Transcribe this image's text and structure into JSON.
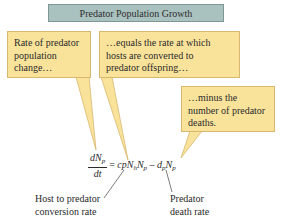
{
  "title": "Predator Population Growth",
  "callouts": [
    {
      "id": "rate-change",
      "lines": [
        "Rate of predator",
        "population",
        "change…"
      ]
    },
    {
      "id": "conversion",
      "lines": [
        "…equals the rate at which",
        "hosts are converted to",
        "predator offspring…"
      ]
    },
    {
      "id": "deaths",
      "lines": [
        "…minus the",
        "number of predator",
        "deaths."
      ]
    }
  ],
  "equation": {
    "numerator": "dN",
    "numerator_sub": "p",
    "denominator": "dt",
    "equals": "=",
    "term1_coef": "cpN",
    "term1_sub1": "h",
    "term1_N": "N",
    "term1_sub2": "p",
    "minus": "–",
    "term2_d": "d",
    "term2_sub1": "p",
    "term2_N": "N",
    "term2_sub2": "p"
  },
  "labels": {
    "conversion": [
      "Host to predator",
      "conversion rate"
    ],
    "death": [
      "Predator",
      "death rate"
    ]
  },
  "colors": {
    "title_fill": "#a9c1bf",
    "callout_fill": "#f9e39a",
    "callout_border": "#d8b86e"
  }
}
